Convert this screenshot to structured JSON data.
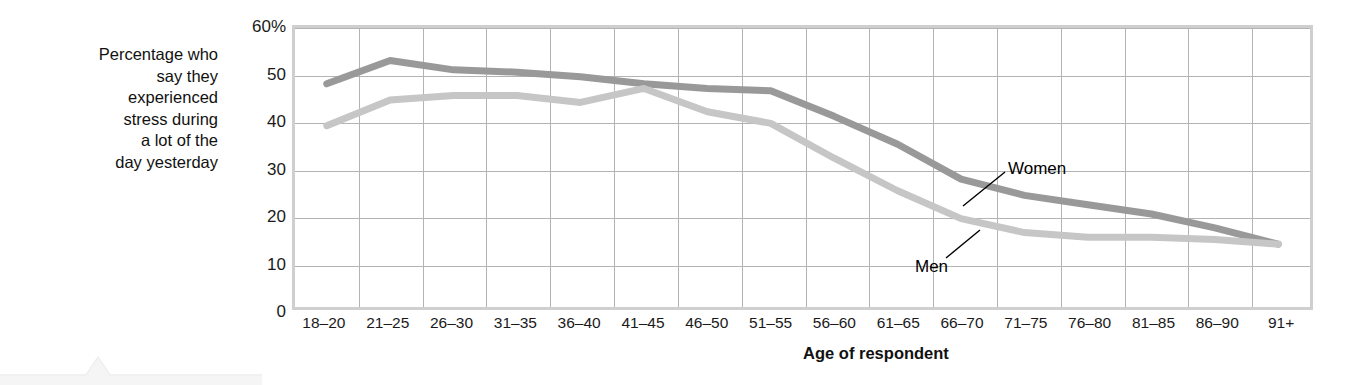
{
  "axis": {
    "y_caption": "Percentage who say they experienced stress during a lot of the day yesterday",
    "y_caption_lines": [
      "Percentage who",
      "say they",
      "experienced",
      "stress during",
      "a lot of the",
      "day yesterday"
    ],
    "x_title": "Age of respondent"
  },
  "colors": {
    "women_line": "#999999",
    "men_line": "#c6c6c6",
    "gridline": "#b3b3b3",
    "frame": "#cfcfcf",
    "text": "#1a1a1a"
  },
  "chart_data": {
    "type": "line",
    "title": "",
    "xlabel": "Age of respondent",
    "ylabel": "Percentage who say they experienced stress during a lot of the day yesterday",
    "ylim": [
      0,
      60
    ],
    "ytick_labels": [
      "60%",
      "50",
      "40",
      "30",
      "20",
      "10",
      "0"
    ],
    "ytick_values": [
      60,
      50,
      40,
      30,
      20,
      10,
      0
    ],
    "grid": true,
    "legend": "inline-annotations",
    "categories": [
      "18–20",
      "21–25",
      "26–30",
      "31–35",
      "36–40",
      "41–45",
      "46–50",
      "51–55",
      "56–60",
      "61–65",
      "66–70",
      "71–75",
      "76–80",
      "81–85",
      "86–90",
      "91+"
    ],
    "series": [
      {
        "name": "Women",
        "color": "#999999",
        "values": [
          48,
          53,
          51,
          50.5,
          49.5,
          48,
          47,
          46.5,
          41,
          35,
          27.5,
          24,
          22,
          20,
          17,
          13.5
        ]
      },
      {
        "name": "Men",
        "color": "#c6c6c6",
        "values": [
          39,
          44.5,
          45.5,
          45.5,
          44,
          47,
          42,
          39.5,
          32,
          25,
          19,
          16,
          15,
          15,
          14.5,
          13.5
        ]
      }
    ],
    "annotations": [
      {
        "text": "Women",
        "series": "Women",
        "at_category": "66–70"
      },
      {
        "text": "Men",
        "series": "Men",
        "at_category": "61–65"
      }
    ]
  }
}
